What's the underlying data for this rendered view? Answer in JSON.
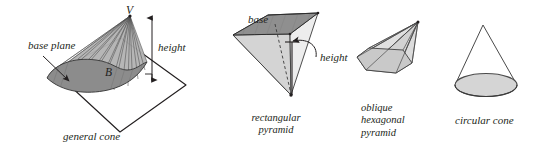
{
  "figure": {
    "title_semantic": "cone-and-pyramid-types-diagram",
    "background_color": "#ffffff",
    "ink_color": "#231f20",
    "panels": [
      {
        "id": "general-cone",
        "caption": "general cone",
        "labels": {
          "apex": "V",
          "base_region": "B",
          "base_plane": "base plane",
          "height": "height"
        },
        "colors": {
          "base_region_fill": "#8c8c8c",
          "lateral_fill": "#b5b5b5",
          "plane_stroke": "#231f20"
        }
      },
      {
        "id": "rectangular-pyramid",
        "caption_line1": "rectangular",
        "caption_line2": "pyramid",
        "labels": {
          "base": "base",
          "height": "height"
        },
        "colors": {
          "base_fill": "#8f8f8f",
          "face_fill": "#d8d8d8"
        }
      },
      {
        "id": "oblique-hexagonal-pyramid",
        "caption_line1": "oblique",
        "caption_line2": "hexagonal",
        "caption_line3": "pyramid",
        "colors": {
          "base_fill": "#c9c9c9",
          "side_fill": "#dedede"
        }
      },
      {
        "id": "circular-cone",
        "caption": "circular cone",
        "colors": {
          "base_fill": "#d5d5d5",
          "stroke": "#4a4a4a"
        }
      }
    ]
  }
}
